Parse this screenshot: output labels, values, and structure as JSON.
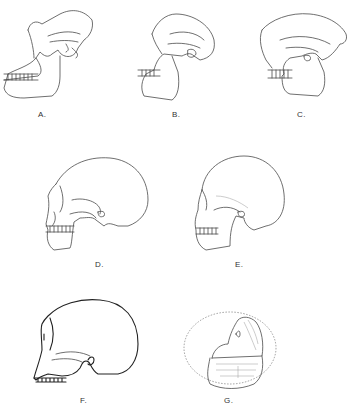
{
  "figure": {
    "type": "line-drawing illustration",
    "panels": [
      {
        "id": "A",
        "label": "A.",
        "icon": "skull-ape-icon"
      },
      {
        "id": "B",
        "label": "B.",
        "icon": "skull-australopith-icon"
      },
      {
        "id": "C",
        "label": "C.",
        "icon": "skull-erectus-icon"
      },
      {
        "id": "D",
        "label": "D.",
        "icon": "skull-neanderthal-icon"
      },
      {
        "id": "E",
        "label": "E.",
        "icon": "skull-modern-icon"
      },
      {
        "id": "F",
        "label": "F.",
        "icon": "skull-cranium-icon"
      },
      {
        "id": "G",
        "label": "G.",
        "icon": "skull-fragment-icon"
      }
    ]
  }
}
